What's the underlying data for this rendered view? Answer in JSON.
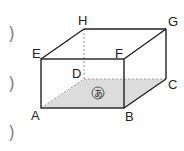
{
  "diagram": {
    "type": "rectangular-prism",
    "vertices": {
      "A": "A",
      "B": "B",
      "C": "C",
      "D": "D",
      "E": "E",
      "F": "F",
      "G": "G",
      "H": "H"
    },
    "shaded_face": {
      "vertices": [
        "A",
        "B",
        "C",
        "D"
      ],
      "label": "あ"
    },
    "hidden_edges": [
      "AD",
      "DC",
      "DH"
    ],
    "colors": {
      "edge": "#222222",
      "hidden_edge": "#9a9a9a",
      "shade": "#d9d9d9"
    }
  },
  "answer_brackets": [
    ")",
    ")",
    ")"
  ]
}
